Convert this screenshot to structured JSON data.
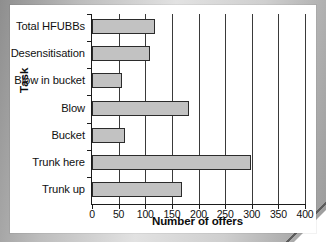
{
  "chart_data": {
    "type": "bar",
    "orientation": "horizontal",
    "title": "",
    "xlabel": "Number of offers",
    "ylabel": "Task",
    "categories": [
      "Trunk up",
      "Trunk here",
      "Bucket",
      "Blow",
      "Blow in bucket",
      "Desensitisation",
      "Total HFUBBs"
    ],
    "values": [
      169,
      298,
      62,
      182,
      56,
      109,
      118
    ],
    "xlim": [
      0,
      400
    ],
    "xticks": [
      0,
      50,
      100,
      150,
      200,
      250,
      300,
      350,
      400
    ],
    "xtick_labels": [
      "0",
      "50",
      "100",
      "150",
      "200",
      "250",
      "300",
      "350",
      "400"
    ],
    "grid": "vertical",
    "legend": null,
    "bar_fill": "#c2c2c2",
    "bar_edge": "#2b2b2b",
    "axis_color": "#1b1b1b",
    "background": "#ffffff"
  },
  "bars": [
    {
      "label": "Total HFUBBs",
      "value": 118
    },
    {
      "label": "Desensitisation",
      "value": 109
    },
    {
      "label": "Blow in bucket",
      "value": 56
    },
    {
      "label": "Blow",
      "value": 182
    },
    {
      "label": "Bucket",
      "value": 62
    },
    {
      "label": "Trunk here",
      "value": 298
    },
    {
      "label": "Trunk up",
      "value": 169
    }
  ],
  "axes": {
    "x_title": "Number of offers",
    "y_title": "Task",
    "x_ticks": [
      "0",
      "50",
      "100",
      "150",
      "200",
      "250",
      "300",
      "350",
      "400"
    ]
  }
}
